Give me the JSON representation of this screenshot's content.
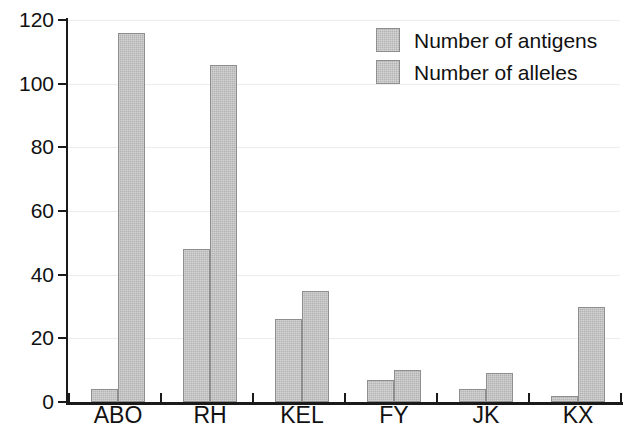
{
  "chart_data": {
    "type": "bar",
    "title": "",
    "subtitle": "",
    "xlabel": "",
    "ylabel": "",
    "categories": [
      "ABO",
      "RH",
      "KEL",
      "FY",
      "JK",
      "KX"
    ],
    "series": [
      {
        "name": "Number of antigens",
        "color": "#b5b5b5",
        "values": [
          4,
          48,
          26,
          7,
          4,
          2
        ]
      },
      {
        "name": "Number of alleles",
        "color": "#b2b2b2",
        "values": [
          116,
          106,
          35,
          10,
          9,
          30
        ]
      }
    ],
    "ylim": [
      0,
      120
    ],
    "yticks": [
      0,
      20,
      40,
      60,
      80,
      100,
      120
    ],
    "ytick_labels": [
      "0",
      "20",
      "40",
      "60",
      "80",
      "100",
      "120"
    ],
    "grid": true,
    "grid_axis": "y",
    "legend": true,
    "legend_position": "top-right",
    "legend_entries": [
      "Number of antigens",
      "Number of alleles"
    ]
  },
  "legend": {
    "entries": [
      {
        "label": "Number of antigens"
      },
      {
        "label": "Number of alleles"
      }
    ]
  },
  "axes": {
    "y": {
      "ticks": [
        "120",
        "100",
        "80",
        "60",
        "40",
        "20",
        "0"
      ]
    },
    "x": {
      "ticks": [
        "ABO",
        "RH",
        "KEL",
        "FY",
        "JK",
        "KX"
      ]
    }
  }
}
